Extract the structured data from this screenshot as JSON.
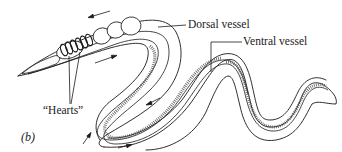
{
  "figure": {
    "panel_label": "(b)",
    "labels": {
      "dorsal": "Dorsal vessel",
      "ventral": "Ventral vessel",
      "hearts": "“Hearts”"
    },
    "flow_arrows": [
      {
        "location": "above-head",
        "direction": "toward-head"
      },
      {
        "location": "below-anterior",
        "direction": "toward-tail"
      },
      {
        "location": "first-bend-inner",
        "direction": "along-body"
      },
      {
        "location": "lower-left-outer",
        "direction": "up"
      },
      {
        "location": "bottom-middle",
        "direction": "right"
      }
    ],
    "colors": {
      "ink": "#1a1a1a",
      "background": "#ffffff"
    }
  }
}
